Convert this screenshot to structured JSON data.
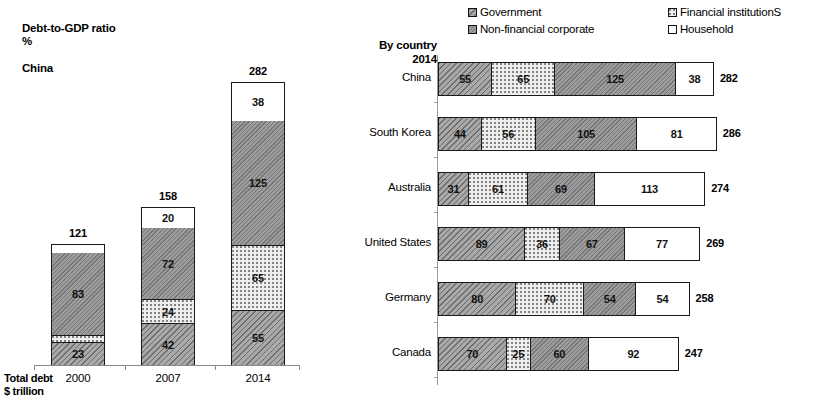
{
  "chart_data": [
    {
      "type": "bar",
      "orientation": "vertical",
      "id": "china-debt-to-gdp",
      "title": "Debt-to-GDP ratio\n%",
      "subtitle": "China",
      "xlabel": "Total debt\n$ trillion",
      "ylabel": "",
      "stacked": true,
      "grid": false,
      "categories": [
        "2000",
        "2007",
        "2014"
      ],
      "totals": [
        121,
        158,
        282
      ],
      "series": [
        {
          "name": "Government",
          "values": [
            23,
            42,
            55
          ],
          "color": "#a9a9a9",
          "pattern": "diagonal-hatch-dark"
        },
        {
          "name": "Financial institutions",
          "values": [
            7,
            24,
            65
          ],
          "color": "#eeeeee",
          "pattern": "dotted-light"
        },
        {
          "name": "Non-financial corporate",
          "values": [
            83,
            72,
            125
          ],
          "color": "#9d9d9d",
          "pattern": "diagonal-hatch-medium"
        },
        {
          "name": "Household",
          "values": [
            8,
            20,
            38
          ],
          "color": "#ffffff",
          "pattern": "solid-white"
        }
      ],
      "segment_labels": [
        [
          "23",
          "",
          "83",
          ""
        ],
        [
          "42",
          "24",
          "72",
          "20"
        ],
        [
          "55",
          "65",
          "125",
          "38"
        ]
      ],
      "ylim": [
        0,
        282
      ]
    },
    {
      "type": "bar",
      "orientation": "horizontal",
      "id": "by-country-2014",
      "title": "By country\n2014",
      "stacked": true,
      "grid": false,
      "categories": [
        "China",
        "South Korea",
        "Australia",
        "United States",
        "Germany",
        "Canada"
      ],
      "totals": [
        282,
        286,
        274,
        269,
        258,
        247
      ],
      "series": [
        {
          "name": "Government",
          "values": [
            55,
            44,
            31,
            89,
            80,
            70
          ],
          "color": "#a9a9a9",
          "pattern": "diagonal-hatch-dark"
        },
        {
          "name": "Financial institutions",
          "values": [
            65,
            56,
            61,
            36,
            70,
            25
          ],
          "color": "#eeeeee",
          "pattern": "dotted-light"
        },
        {
          "name": "Non-financial corporate",
          "values": [
            125,
            105,
            69,
            67,
            54,
            60
          ],
          "color": "#9d9d9d",
          "pattern": "diagonal-hatch-medium"
        },
        {
          "name": "Household",
          "values": [
            38,
            81,
            113,
            77,
            54,
            92
          ],
          "color": "#ffffff",
          "pattern": "solid-white"
        }
      ],
      "xlim": [
        0,
        286
      ]
    }
  ],
  "left": {
    "title": "Debt-to-GDP ratio\n%",
    "subtitle": "China",
    "footnote": "Total debt\n$ trillion",
    "bars": [
      {
        "category": "2000",
        "total": "121",
        "segments": [
          {
            "label": "",
            "value": 8,
            "key": "household"
          },
          {
            "label": "83",
            "value": 83,
            "key": "nonfinancial"
          },
          {
            "label": "",
            "value": 7,
            "key": "financial"
          },
          {
            "label": "23",
            "value": 23,
            "key": "government"
          }
        ]
      },
      {
        "category": "2007",
        "total": "158",
        "segments": [
          {
            "label": "20",
            "value": 20,
            "key": "household"
          },
          {
            "label": "72",
            "value": 72,
            "key": "nonfinancial"
          },
          {
            "label": "24",
            "value": 24,
            "key": "financial"
          },
          {
            "label": "42",
            "value": 42,
            "key": "government"
          }
        ]
      },
      {
        "category": "2014",
        "total": "282",
        "segments": [
          {
            "label": "38",
            "value": 38,
            "key": "household"
          },
          {
            "label": "125",
            "value": 125,
            "key": "nonfinancial"
          },
          {
            "label": "65",
            "value": 65,
            "key": "financial"
          },
          {
            "label": "55",
            "value": 55,
            "key": "government"
          }
        ]
      }
    ]
  },
  "legend": {
    "items": [
      {
        "label": "Government",
        "key": "government"
      },
      {
        "label": "Non-financial corporate",
        "key": "nonfinancial"
      },
      {
        "label": "Financial institutionS",
        "key": "financial"
      },
      {
        "label": "Household",
        "key": "household"
      }
    ]
  },
  "right": {
    "header": "By country\n2014",
    "rows": [
      {
        "country": "China",
        "total": "282",
        "segments": [
          {
            "label": "55",
            "value": 55,
            "key": "government"
          },
          {
            "label": "65",
            "value": 65,
            "key": "financial"
          },
          {
            "label": "125",
            "value": 125,
            "key": "nonfinancial"
          },
          {
            "label": "38",
            "value": 38,
            "key": "household"
          }
        ]
      },
      {
        "country": "South Korea",
        "total": "286",
        "segments": [
          {
            "label": "44",
            "value": 44,
            "key": "government"
          },
          {
            "label": "56",
            "value": 56,
            "key": "financial"
          },
          {
            "label": "105",
            "value": 105,
            "key": "nonfinancial"
          },
          {
            "label": "81",
            "value": 81,
            "key": "household"
          }
        ]
      },
      {
        "country": "Australia",
        "total": "274",
        "segments": [
          {
            "label": "31",
            "value": 31,
            "key": "government"
          },
          {
            "label": "61",
            "value": 61,
            "key": "financial"
          },
          {
            "label": "69",
            "value": 69,
            "key": "nonfinancial"
          },
          {
            "label": "113",
            "value": 113,
            "key": "household"
          }
        ]
      },
      {
        "country": "United States",
        "total": "269",
        "segments": [
          {
            "label": "89",
            "value": 89,
            "key": "government"
          },
          {
            "label": "36",
            "value": 36,
            "key": "financial"
          },
          {
            "label": "67",
            "value": 67,
            "key": "nonfinancial"
          },
          {
            "label": "77",
            "value": 77,
            "key": "household"
          }
        ]
      },
      {
        "country": "Germany",
        "total": "258",
        "segments": [
          {
            "label": "80",
            "value": 80,
            "key": "government"
          },
          {
            "label": "70",
            "value": 70,
            "key": "financial"
          },
          {
            "label": "54",
            "value": 54,
            "key": "nonfinancial"
          },
          {
            "label": "54",
            "value": 54,
            "key": "household"
          }
        ]
      },
      {
        "country": "Canada",
        "total": "247",
        "segments": [
          {
            "label": "70",
            "value": 70,
            "key": "government"
          },
          {
            "label": "25",
            "value": 25,
            "key": "financial"
          },
          {
            "label": "60",
            "value": 60,
            "key": "nonfinancial"
          },
          {
            "label": "92",
            "value": 92,
            "key": "household"
          }
        ]
      }
    ]
  }
}
